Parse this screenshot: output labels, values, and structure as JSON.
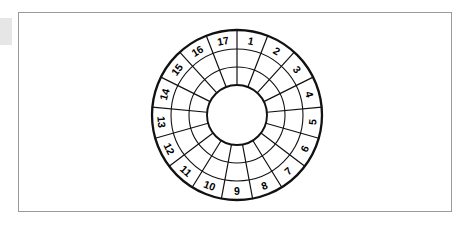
{
  "page": {
    "background_color": "#ffffff",
    "width": 476,
    "height": 229
  },
  "artifact": {
    "name": "scan-edge-artifact",
    "color": "#e6e6e6"
  },
  "frame": {
    "border_color": "#9a9a9a",
    "fill_color": "#ffffff"
  },
  "figure": {
    "type": "segmented-wheel-diagram",
    "title": "",
    "stroke_color": "#111111",
    "fill_color": "#ffffff",
    "center_x": 237,
    "center_y": 115,
    "outer_radius": 85,
    "ring_radii": [
      85,
      66,
      48,
      30
    ],
    "hub_radius": 30,
    "ring_count": 3,
    "sector_count": 17,
    "start_angle_deg": -90,
    "direction": "clockwise",
    "labeled_ring": "outer",
    "labels": [
      "1",
      "2",
      "3",
      "4",
      "5",
      "6",
      "7",
      "8",
      "9",
      "10",
      "11",
      "12",
      "13",
      "14",
      "15",
      "16",
      "17"
    ]
  }
}
